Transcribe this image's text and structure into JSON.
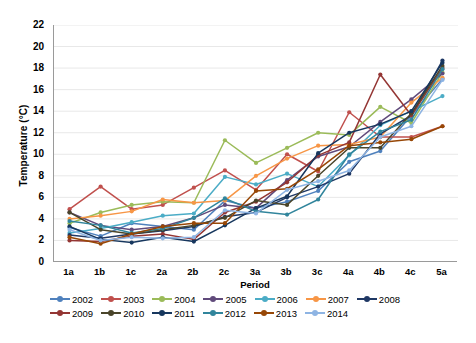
{
  "chart_data": {
    "type": "line",
    "title": "",
    "xlabel": "Period",
    "ylabel": "Temperature (°C)",
    "categories": [
      "1a",
      "1b",
      "1c",
      "2a",
      "2b",
      "2c",
      "3a",
      "3b",
      "3c",
      "4a",
      "4b",
      "4c",
      "5a"
    ],
    "ylim": [
      0,
      22
    ],
    "ytick_step": 2,
    "yticks": [
      0,
      2,
      4,
      6,
      8,
      10,
      12,
      14,
      16,
      18,
      20,
      22
    ],
    "grid": "horizontal",
    "legend_position": "bottom",
    "markers": "filled-circle",
    "series": [
      {
        "name": "2002",
        "color": "#4f81bd",
        "values": [
          3.2,
          2.4,
          3.6,
          3.3,
          3.0,
          5.7,
          5.0,
          5.6,
          6.6,
          9.3,
          10.3,
          13.6,
          17.0
        ]
      },
      {
        "name": "2003",
        "color": "#c0504d",
        "values": [
          4.9,
          7.0,
          4.9,
          5.3,
          6.9,
          8.5,
          6.7,
          10.0,
          8.4,
          13.9,
          11.6,
          11.6,
          12.6
        ]
      },
      {
        "name": "2004",
        "color": "#9bbb59",
        "values": [
          3.6,
          4.6,
          5.3,
          5.6,
          5.5,
          11.3,
          9.2,
          10.6,
          12.0,
          11.8,
          14.4,
          12.9,
          17.6
        ]
      },
      {
        "name": "2005",
        "color": "#604a7b",
        "values": [
          4.6,
          3.4,
          3.0,
          3.3,
          4.1,
          5.3,
          5.0,
          7.6,
          9.8,
          10.7,
          13.0,
          15.1,
          17.5
        ]
      },
      {
        "name": "2006",
        "color": "#4bacc6",
        "values": [
          2.7,
          3.1,
          3.7,
          4.3,
          4.5,
          7.9,
          7.2,
          8.2,
          7.0,
          9.9,
          12.7,
          14.0,
          15.4
        ]
      },
      {
        "name": "2007",
        "color": "#f79646",
        "values": [
          4.0,
          4.3,
          4.7,
          5.8,
          5.5,
          5.7,
          8.0,
          9.6,
          10.8,
          10.9,
          11.6,
          14.8,
          17.1
        ]
      },
      {
        "name": "2008",
        "color": "#1f3864",
        "values": [
          2.5,
          2.2,
          2.6,
          2.9,
          3.3,
          4.2,
          4.6,
          6.0,
          7.0,
          8.2,
          11.9,
          13.6,
          18.7
        ]
      },
      {
        "name": "2009",
        "color": "#943634",
        "values": [
          2.0,
          1.9,
          2.4,
          2.6,
          2.1,
          4.6,
          5.6,
          7.4,
          9.9,
          11.1,
          17.4,
          13.6,
          18.0
        ]
      },
      {
        "name": "2010",
        "color": "#4a452a",
        "values": [
          4.6,
          3.0,
          2.6,
          3.0,
          3.4,
          4.1,
          5.7,
          5.3,
          8.0,
          10.6,
          10.6,
          13.8,
          18.2
        ]
      },
      {
        "name": "2011",
        "color": "#17375e",
        "values": [
          3.3,
          2.1,
          1.8,
          2.3,
          1.9,
          3.4,
          5.0,
          6.1,
          10.1,
          12.0,
          12.8,
          14.0,
          18.5
        ]
      },
      {
        "name": "2012",
        "color": "#31859c",
        "values": [
          3.8,
          3.4,
          2.7,
          3.1,
          4.1,
          5.9,
          4.7,
          4.4,
          5.8,
          10.0,
          12.1,
          13.2,
          17.9
        ]
      },
      {
        "name": "2013",
        "color": "#974706",
        "values": [
          2.3,
          1.7,
          2.6,
          3.3,
          3.6,
          3.6,
          6.6,
          6.8,
          8.6,
          10.8,
          11.1,
          11.4,
          12.6
        ]
      },
      {
        "name": "2014",
        "color": "#8eb4e3",
        "values": [
          3.0,
          2.0,
          2.3,
          2.2,
          2.3,
          4.8,
          4.5,
          6.7,
          7.5,
          8.5,
          11.6,
          12.6,
          16.9
        ]
      }
    ]
  }
}
